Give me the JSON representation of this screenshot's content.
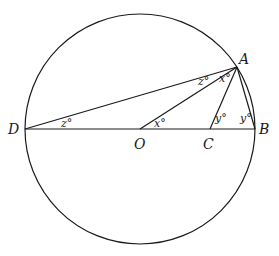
{
  "diagram": {
    "type": "circle-geometry",
    "circle": {
      "cx": 140,
      "cy": 129,
      "r": 115
    },
    "points": {
      "A": {
        "label": "A",
        "x": 237,
        "y": 67
      },
      "B": {
        "label": "B",
        "x": 255,
        "y": 129
      },
      "C": {
        "label": "C",
        "x": 210,
        "y": 129
      },
      "D": {
        "label": "D",
        "x": 25,
        "y": 129
      },
      "O": {
        "label": "O",
        "x": 140,
        "y": 129
      }
    },
    "angle_labels": {
      "z_at_D": "z°",
      "z_at_A": "z°",
      "x_at_A": "x°",
      "x_at_O": "x°",
      "y_at_C": "y°",
      "y_at_B": "y°"
    },
    "colors": {
      "stroke": "#1a1a1a",
      "background": "#ffffff"
    }
  }
}
